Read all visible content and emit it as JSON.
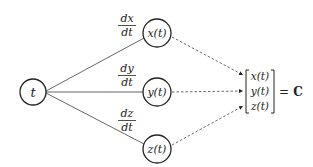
{
  "diagram": {
    "source_node": {
      "label": "t",
      "cx": 33,
      "cy": 92,
      "r": 13
    },
    "nodes": [
      {
        "id": "x",
        "label": "x(t)",
        "cx": 157,
        "cy": 33,
        "r": 14
      },
      {
        "id": "y",
        "label": "y(t)",
        "cx": 157,
        "cy": 92,
        "r": 14
      },
      {
        "id": "z",
        "label": "z(t)",
        "cx": 157,
        "cy": 149,
        "r": 14
      }
    ],
    "edge_labels": [
      {
        "num": "dx",
        "den": "dt"
      },
      {
        "num": "dy",
        "den": "dt"
      },
      {
        "num": "dz",
        "den": "dt"
      }
    ],
    "matrix": {
      "entries": [
        "x(t)",
        "y(t)",
        "z(t)"
      ],
      "equals": "=",
      "result": "C"
    },
    "colors": {
      "stroke": "#222222",
      "background": "#ffffff"
    }
  }
}
